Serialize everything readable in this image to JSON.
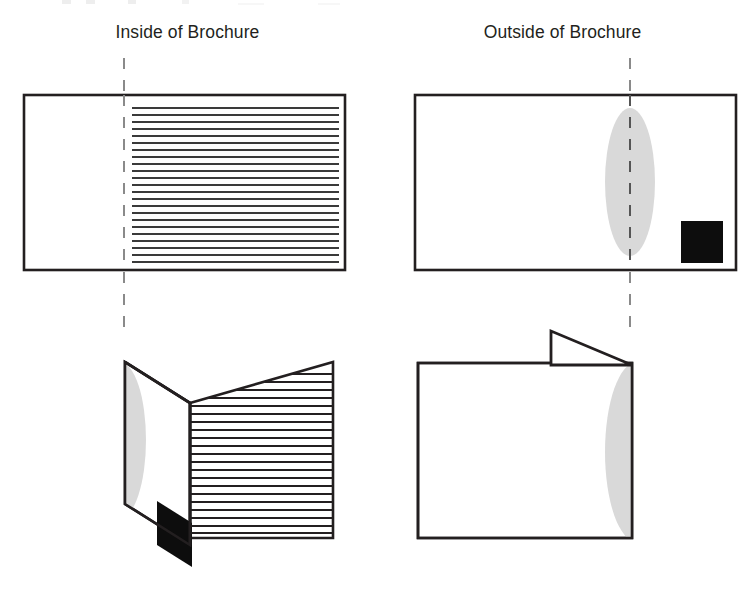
{
  "figure": {
    "titles": {
      "inside": "Inside of Brochure",
      "outside": "Outside of Brochure"
    },
    "colors": {
      "stroke": "#231f20",
      "fill_white": "#ffffff",
      "ellipse_gray": "#d9d9d9",
      "square_black": "#0d0d0d",
      "fold_dash": "#8a8a8a",
      "text_rule": "#3a3a3a",
      "background": "#ffffff"
    },
    "panels": [
      {
        "id": "inside-flat",
        "label": "Inside of Brochure",
        "view": "flat",
        "rect": {
          "x": 24,
          "y": 95,
          "width": 321,
          "height": 175
        },
        "fold_line_x": 124,
        "content": {
          "left_half": "blank",
          "right_half": "text-lines",
          "text_line_count": 23
        }
      },
      {
        "id": "outside-flat",
        "label": "Outside of Brochure",
        "view": "flat",
        "rect": {
          "x": 415,
          "y": 95,
          "width": 321,
          "height": 175
        },
        "fold_line_x": 630,
        "content": {
          "ellipse": {
            "cx": 630,
            "cy": 182,
            "rx": 25,
            "ry": 74,
            "fill": "gray"
          },
          "square": {
            "x": 681,
            "y": 221,
            "size": 42,
            "fill": "black"
          }
        }
      },
      {
        "id": "inside-folded",
        "label": "Inside of Brochure, folded open",
        "view": "3d",
        "content": {
          "flap": "left panel angled back showing gray ellipse half and black square",
          "front_panel": "text-lines",
          "text_line_count": 23
        }
      },
      {
        "id": "outside-folded",
        "label": "Outside of Brochure, folded closed",
        "view": "3d",
        "content": {
          "flap": "triangular back flap angled away at top right",
          "front_panel": "blank with gray half-ellipse clipped at right fold edge"
        }
      }
    ],
    "fold_guides": [
      {
        "for": "inside",
        "x": 124,
        "segments": [
          [
            58,
            95
          ],
          [
            95,
            270
          ],
          [
            270,
            332
          ]
        ]
      },
      {
        "for": "outside",
        "x": 630,
        "segments": [
          [
            58,
            95
          ],
          [
            95,
            270
          ],
          [
            270,
            332
          ]
        ]
      }
    ],
    "icons": {
      "fold_line": "dashed-fold-line-icon",
      "text_block": "text-lines-icon",
      "logo_ellipse": "ellipse-shape-icon",
      "photo_square": "filled-square-icon"
    }
  }
}
